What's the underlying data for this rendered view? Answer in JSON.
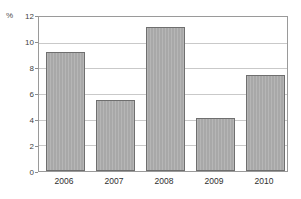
{
  "chart_data": {
    "type": "bar",
    "title": "",
    "xlabel": "",
    "ylabel": "%",
    "unit_label": "%",
    "categories": [
      "2006",
      "2007",
      "2008",
      "2009",
      "2010"
    ],
    "values": [
      9.3,
      5.5,
      11.25,
      4.15,
      7.5
    ],
    "series": [
      {
        "name": "",
        "values": [
          9.3,
          5.5,
          11.25,
          4.15,
          7.5
        ]
      }
    ],
    "ylim": [
      0,
      12
    ],
    "ytick_labels": [
      "0",
      "2",
      "4",
      "6",
      "8",
      "10",
      "12"
    ],
    "ytick_values": [
      0,
      2,
      4,
      6,
      8,
      10,
      12
    ],
    "grid": "horizontal",
    "legend": "none",
    "bar_color": "#a8a8a8",
    "bar_edge_color": "#6f6f6f",
    "gridline_color": "#c9c9c9",
    "axis_color": "#9a9a9a",
    "background_color": "#ffffff",
    "text_color": "#2f2f2f"
  },
  "figure": {
    "title_fragment": ""
  }
}
